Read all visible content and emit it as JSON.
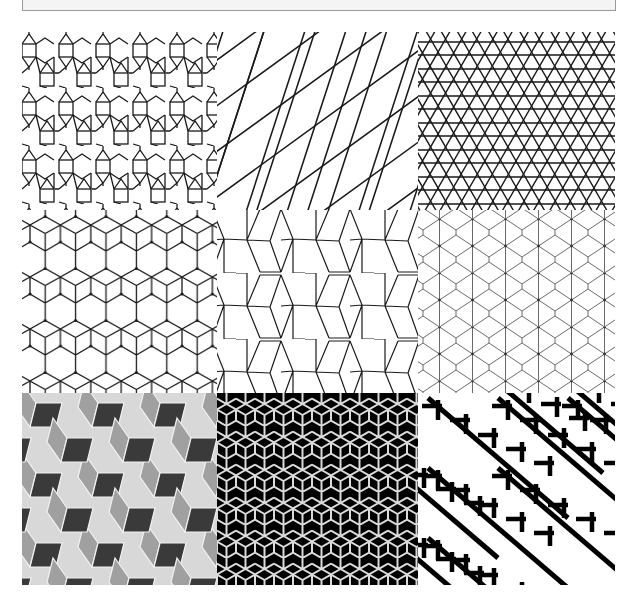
{
  "header": {
    "title": ""
  },
  "figure": {
    "layout": {
      "rows": 3,
      "columns": 3
    },
    "panels": [
      {
        "id": 1,
        "pattern": "square-triangle-hexagon-tiling",
        "style": "black-lines-on-white",
        "stroke": "#1a1a1a"
      },
      {
        "id": 2,
        "pattern": "rotated-snub-square-lines",
        "style": "black-lines-on-white",
        "stroke": "#1a1a1a"
      },
      {
        "id": 3,
        "pattern": "trihexagonal-star-lattice",
        "style": "black-lines-on-white",
        "stroke": "#1a1a1a"
      },
      {
        "id": 4,
        "pattern": "rhombille-cube-lines",
        "style": "black-lines-on-white",
        "stroke": "#1a1a1a"
      },
      {
        "id": 5,
        "pattern": "cairo-pentagonal-tiling",
        "style": "black-lines-on-white",
        "stroke": "#1a1a1a"
      },
      {
        "id": 6,
        "pattern": "elongated-hexagon-lines",
        "style": "gray-lines-on-white",
        "stroke": "#6a6a6a"
      },
      {
        "id": 7,
        "pattern": "shaded-isometric-cubes",
        "style": "three-tone-gray",
        "colors": [
          "#d8d8d8",
          "#a0a0a0",
          "#3a3a3a"
        ]
      },
      {
        "id": 8,
        "pattern": "black-rhombus-stars",
        "style": "white-lines-on-black",
        "colors": [
          "#000000",
          "#dcdcdc"
        ]
      },
      {
        "id": 9,
        "pattern": "zollner-zigzag-illusion",
        "style": "black-bars-on-white",
        "colors": [
          "#000000",
          "#ffffff"
        ]
      }
    ]
  }
}
